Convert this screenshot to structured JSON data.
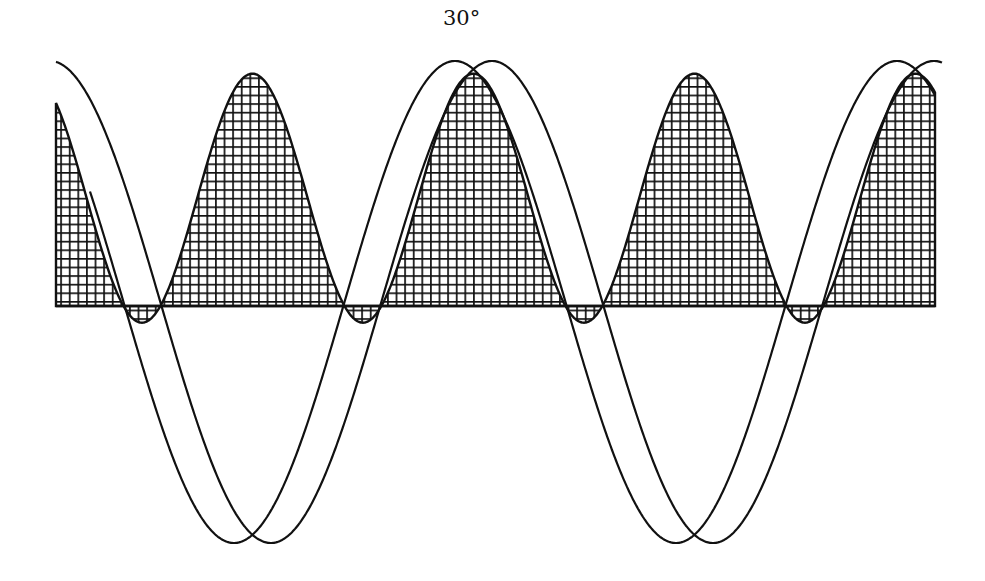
{
  "diagram": {
    "title": "",
    "phase_label": "30°"
  },
  "chart_data": {
    "type": "line",
    "title": "",
    "xlabel": "",
    "ylabel": "",
    "annotations": [
      "30°"
    ],
    "phase_shift_deg": 30,
    "grid": false,
    "series": [
      {
        "name": "voltage",
        "kind": "sine",
        "amplitude": 1.0,
        "phase_deg": 0,
        "style": "line"
      },
      {
        "name": "current",
        "kind": "sine",
        "amplitude": 1.0,
        "phase_deg": -30,
        "style": "line"
      },
      {
        "name": "power",
        "kind": "product",
        "formula": "v*i",
        "max": 0.933,
        "min": -0.067,
        "style": "cross-hatched fill"
      }
    ],
    "x_range_deg": [
      -325,
      390
    ],
    "y_range": [
      -1,
      1
    ]
  },
  "layout": {
    "x_left": 56,
    "x_right": 935,
    "baseline_y": 306,
    "wave_center_y": 302,
    "wave_amplitude_px": 241,
    "power_scale_px": 249,
    "voltage_peak_x": 455,
    "period_px": 442,
    "hatch_spacing_px": 8.6,
    "stroke_color": "#111111"
  }
}
